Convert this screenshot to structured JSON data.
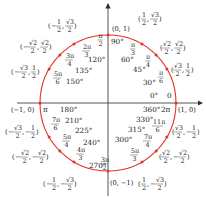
{
  "diagram": {
    "colors": {
      "circle": "#e0352b",
      "axis": "#333333",
      "text": "#1a1a1a"
    },
    "geometry": {
      "cx": 108,
      "cy": 103,
      "r": 68
    },
    "axes": {
      "x_label_pos": "(1, 0)",
      "x_label_neg": "(−1, 0)",
      "y_label_pos": "(0, 1)",
      "y_label_neg": "(0, −1)"
    },
    "points": [
      {
        "deg": "0°",
        "rad": "0",
        "coord_x": "1",
        "coord_y": "0",
        "angle": 0
      },
      {
        "deg": "30°",
        "rad_num": "π",
        "rad_den": "6",
        "coord": "(√3/2, 1/2)",
        "angle": 30
      },
      {
        "deg": "45°",
        "rad_num": "π",
        "rad_den": "4",
        "coord": "(√2/2, √2/2)",
        "angle": 45
      },
      {
        "deg": "60°",
        "rad_num": "π",
        "rad_den": "3",
        "coord": "(1/2, √3/2)",
        "angle": 60
      },
      {
        "deg": "90°",
        "rad_num": "π",
        "rad_den": "2",
        "coord": "(0, 1)",
        "angle": 90
      },
      {
        "deg": "120°",
        "rad_num": "2π",
        "rad_den": "3",
        "coord": "(−1/2, √3/2)",
        "angle": 120
      },
      {
        "deg": "135°",
        "rad_num": "3π",
        "rad_den": "4",
        "coord": "(−√2/2, √2/2)",
        "angle": 135
      },
      {
        "deg": "150°",
        "rad_num": "5π",
        "rad_den": "6",
        "coord": "(−√3/2, 1/2)",
        "angle": 150
      },
      {
        "deg": "180°",
        "rad": "π",
        "coord": "(−1, 0)",
        "angle": 180
      },
      {
        "deg": "210°",
        "rad_num": "7π",
        "rad_den": "6",
        "coord": "(−√3/2, −1/2)",
        "angle": 210
      },
      {
        "deg": "225°",
        "rad_num": "5π",
        "rad_den": "4",
        "coord": "(−√2/2, −√2/2)",
        "angle": 225
      },
      {
        "deg": "240°",
        "rad_num": "4π",
        "rad_den": "3",
        "coord": "(−1/2, −√3/2)",
        "angle": 240
      },
      {
        "deg": "270°",
        "rad_num": "3π",
        "rad_den": "2",
        "coord": "(0, −1)",
        "angle": 270
      },
      {
        "deg": "300°",
        "rad_num": "5π",
        "rad_den": "3",
        "coord": "(1/2, −√3/2)",
        "angle": 300
      },
      {
        "deg": "315°",
        "rad_num": "7π",
        "rad_den": "4",
        "coord": "(√2/2, −√2/2)",
        "angle": 315
      },
      {
        "deg": "330°",
        "rad_num": "11π",
        "rad_den": "6",
        "coord": "(√3/2, −1/2)",
        "angle": 330
      },
      {
        "deg": "360°",
        "rad": "2π",
        "coord": "(1, 0)",
        "angle": 360
      }
    ],
    "labels": {
      "deg_0": "0°",
      "rad_0": "0",
      "deg_360": "360°",
      "rad_360": "2π",
      "deg_90": "90°",
      "deg_60": "60°",
      "deg_45": "45°",
      "deg_30": "30°",
      "deg_120": "120°",
      "deg_135": "135°",
      "deg_150": "150°",
      "deg_180": "180°",
      "rad_180": "π",
      "deg_210": "210°",
      "deg_225": "225°",
      "deg_240": "240°",
      "deg_270": "270°",
      "deg_300": "300°",
      "deg_315": "315°",
      "deg_330": "330°",
      "pi": "π",
      "n2pi": "2π",
      "n3pi": "3π",
      "n4pi": "4π",
      "n5pi": "5π",
      "n7pi": "7π",
      "n11pi": "11π",
      "d2": "2",
      "d3": "3",
      "d4": "4",
      "d6": "6",
      "one": "1",
      "minus": "−",
      "comma": ",",
      "lp": "(",
      "rp": ")",
      "sqrt2": "√2",
      "sqrt3": "√3"
    }
  }
}
